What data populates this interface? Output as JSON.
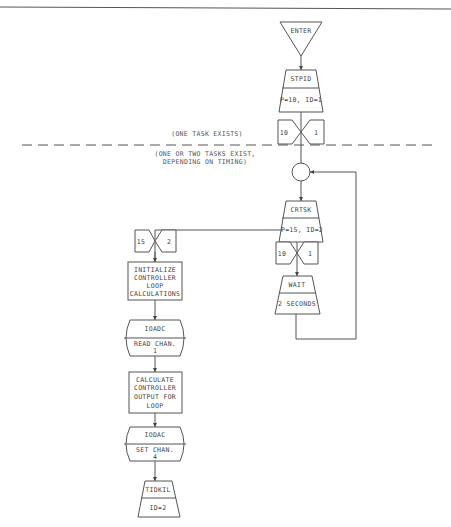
{
  "diagram": {
    "annotations": {
      "one_task": "(ONE TASK EXISTS)",
      "two_tasks_line1": "(ONE OR TWO TASKS EXIST,",
      "two_tasks_line2": "DEPENDING ON TIMING)"
    },
    "main_flow": {
      "enter": "ENTER",
      "stpid": {
        "name": "STPID",
        "params": "P=10, ID=1"
      },
      "task1_marker": {
        "priority": "10",
        "id": "1"
      },
      "crtsk": {
        "name": "CRTSK",
        "params": "P=15, ID=2"
      },
      "task1_marker_2": {
        "priority": "10",
        "id": "1"
      },
      "wait": {
        "name": "WAIT",
        "params": "2 SECONDS"
      }
    },
    "spawned_flow": {
      "task2_marker": {
        "priority": "15",
        "id": "2"
      },
      "init": [
        "INITIALIZE",
        "CONTROLLER",
        "LOOP",
        "CALCULATIONS"
      ],
      "ioadc": {
        "name": "IOADC",
        "params_line1": "READ CHAN.",
        "params_line2": "1"
      },
      "calc": [
        "CALCULATE",
        "CONTROLLER",
        "OUTPUT FOR",
        "LOOP"
      ],
      "iodac": {
        "name": "IODAC",
        "params_line1": "SET CHAN.",
        "params_line2": "4"
      },
      "tidkil": {
        "name": "TIDKIL",
        "params": "ID=2"
      }
    }
  }
}
